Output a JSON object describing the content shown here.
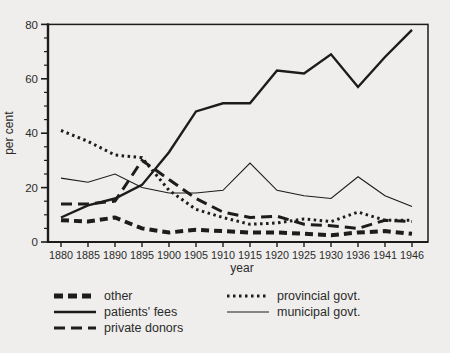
{
  "colors": {
    "line": "#1c1c1c",
    "background": "#efeeec",
    "text": "#2b2b2b"
  },
  "chart_data": {
    "type": "line",
    "title": "",
    "xlabel": "year",
    "ylabel": "per cent",
    "ylim": [
      0,
      80
    ],
    "yticks": [
      0,
      20,
      40,
      60,
      80
    ],
    "yminor_step": 5,
    "grid": false,
    "legend_position": "below",
    "categories": [
      1880,
      1885,
      1890,
      1895,
      1900,
      1905,
      1910,
      1915,
      1920,
      1925,
      1930,
      1936,
      1941,
      1946
    ],
    "series": [
      {
        "name": "other",
        "style": "thick-short-dash",
        "values": [
          8,
          7.5,
          9,
          5,
          3.5,
          4.5,
          4,
          3.5,
          3.5,
          3,
          2.5,
          3.5,
          4,
          3
        ]
      },
      {
        "name": "patients' fees",
        "style": "thick-solid",
        "values": [
          9,
          13.5,
          16,
          21,
          33,
          48,
          51,
          51,
          63,
          62,
          69,
          57,
          68,
          78
        ]
      },
      {
        "name": "private donors",
        "style": "thick-long-dash",
        "values": [
          14,
          14,
          15,
          30,
          23,
          16,
          11,
          9,
          9.5,
          6.5,
          6,
          5,
          8,
          7.5
        ]
      },
      {
        "name": "provincial govt.",
        "style": "thick-dotted",
        "values": [
          41,
          37,
          32,
          31,
          19,
          12,
          9,
          6.5,
          7,
          8.5,
          7.5,
          11,
          8,
          8
        ]
      },
      {
        "name": "municipal govt.",
        "style": "thin-solid",
        "values": [
          23.5,
          22,
          25,
          20,
          18,
          18,
          19,
          29,
          19,
          17,
          16,
          24,
          17,
          13
        ]
      }
    ]
  }
}
